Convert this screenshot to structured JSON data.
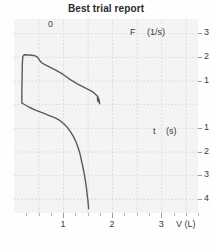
{
  "title": "Best trial report",
  "colors": {
    "curve": "#5a5a5a",
    "grid": "#d8d8d8",
    "plot_background": "#f4f4f4",
    "text": "#3a3a3a",
    "title_text": "#2b2b2b"
  },
  "labels": {
    "zero": "0",
    "flow_axis": "F",
    "flow_unit": "(1/s)",
    "time_axis": "t",
    "time_unit": "(s)",
    "volume_axis": "V (L)"
  },
  "axes": {
    "flow_ticks": [
      "3",
      "2",
      "1"
    ],
    "time_ticks": [
      "1",
      "2",
      "3",
      "4"
    ],
    "volume_ticks": [
      "1",
      "2",
      "3"
    ]
  },
  "chart_data": {
    "type": "line",
    "title": "Best trial report",
    "subtitle": "",
    "xlabel": "V (L)",
    "ylabel": "F (1/s)  /  t (s)",
    "xlim": [
      0,
      3.75
    ],
    "ylim": [
      -4.6,
      3.6
    ],
    "grid": true,
    "legend_position": "none",
    "annotations": [
      {
        "text": "0",
        "x": 0.72,
        "y": 3.1
      },
      {
        "text": "F",
        "x": 2.42,
        "y": 2.75
      },
      {
        "text": "(1/s)",
        "x": 2.78,
        "y": 2.75
      },
      {
        "text": "t",
        "x": 2.88,
        "y": -1.05
      },
      {
        "text": "(s)",
        "x": 3.14,
        "y": -1.05
      }
    ],
    "xticks": [
      1,
      2,
      3
    ],
    "xticklabels": [
      "1",
      "2",
      "3"
    ],
    "yticks": [
      3,
      2,
      1,
      -1,
      -2,
      -3,
      -4
    ],
    "yticklabels": [
      "3",
      "2",
      "1",
      "1",
      "2",
      "3",
      "4"
    ],
    "series": [
      {
        "name": "Expiratory limb (flow vs volume)",
        "points": [
          [
            0.16,
            0.07
          ],
          [
            0.16,
            0.55
          ],
          [
            0.165,
            1.15
          ],
          [
            0.17,
            1.72
          ],
          [
            0.18,
            2.02
          ],
          [
            0.21,
            2.09
          ],
          [
            0.3,
            2.08
          ],
          [
            0.4,
            2.06
          ],
          [
            0.47,
            2.01
          ],
          [
            0.52,
            1.86
          ],
          [
            0.57,
            1.74
          ],
          [
            0.64,
            1.66
          ],
          [
            0.74,
            1.56
          ],
          [
            0.85,
            1.44
          ],
          [
            0.96,
            1.31
          ],
          [
            1.06,
            1.17
          ],
          [
            1.14,
            1.05
          ],
          [
            1.2,
            0.97
          ],
          [
            1.28,
            0.87
          ],
          [
            1.38,
            0.76
          ],
          [
            1.49,
            0.65
          ],
          [
            1.58,
            0.55
          ],
          [
            1.64,
            0.46
          ],
          [
            1.68,
            0.38
          ],
          [
            1.71,
            0.3
          ],
          [
            1.73,
            0.22
          ],
          [
            1.735,
            0.16
          ],
          [
            1.72,
            0.1
          ],
          [
            1.705,
            0.14
          ],
          [
            1.7,
            0.26
          ],
          [
            1.705,
            0.34
          ],
          [
            1.72,
            0.26
          ],
          [
            1.74,
            0.12
          ],
          [
            1.745,
            0.02
          ]
        ]
      },
      {
        "name": "Inspiratory limb (volume vs time)",
        "points": [
          [
            0.16,
            0.05
          ],
          [
            0.3,
            -0.12
          ],
          [
            0.46,
            -0.27
          ],
          [
            0.6,
            -0.38
          ],
          [
            0.72,
            -0.48
          ],
          [
            0.84,
            -0.58
          ],
          [
            0.94,
            -0.7
          ],
          [
            1.02,
            -0.84
          ],
          [
            1.09,
            -0.99
          ],
          [
            1.15,
            -1.16
          ],
          [
            1.21,
            -1.36
          ],
          [
            1.26,
            -1.58
          ],
          [
            1.3,
            -1.8
          ],
          [
            1.335,
            -2.02
          ],
          [
            1.36,
            -2.24
          ],
          [
            1.385,
            -2.48
          ],
          [
            1.41,
            -2.72
          ],
          [
            1.435,
            -2.98
          ],
          [
            1.455,
            -3.24
          ],
          [
            1.475,
            -3.52
          ],
          [
            1.49,
            -3.8
          ],
          [
            1.505,
            -4.05
          ],
          [
            1.515,
            -4.26
          ],
          [
            1.52,
            -4.42
          ]
        ]
      }
    ]
  }
}
